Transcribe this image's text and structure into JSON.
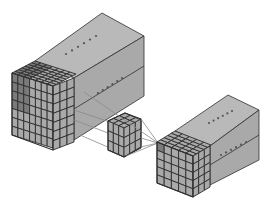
{
  "diagram": {
    "title": "",
    "colors": {
      "background": "#ffffff",
      "face_side": "#a9a9a9",
      "face_top": "#b9b9b9",
      "face_front": "#a0a0a0",
      "grid_line": "#2e2e2e",
      "highlight": "#7a7a7a",
      "arrow": "#8a8a8a",
      "dots": "#555555"
    },
    "nodes": [
      {
        "id": "input-volume",
        "label": "",
        "grid": [
          7,
          7,
          7
        ],
        "ellipsis_rows": 2
      },
      {
        "id": "kernel",
        "label": "",
        "grid": [
          3,
          3,
          3
        ]
      },
      {
        "id": "output-volume",
        "label": "",
        "grid": [
          5,
          5,
          5
        ],
        "ellipsis_rows": 2
      }
    ],
    "edges": [
      {
        "from": "input-volume",
        "to": "kernel",
        "count": 3
      },
      {
        "from": "kernel",
        "to": "output-volume",
        "count": 4
      }
    ]
  }
}
